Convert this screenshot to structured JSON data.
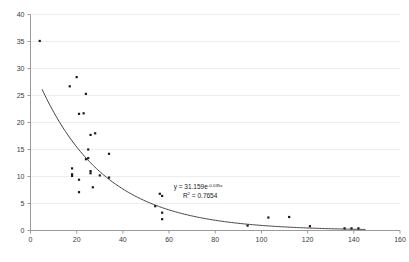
{
  "chart_data": {
    "type": "scatter",
    "title": "",
    "subtitle": "",
    "xlabel": "",
    "ylabel": "",
    "xlim": [
      0,
      160
    ],
    "ylim": [
      0,
      40
    ],
    "xticks": [
      0,
      20,
      40,
      60,
      80,
      100,
      120,
      140,
      160
    ],
    "yticks": [
      0,
      5,
      10,
      15,
      20,
      25,
      30,
      35,
      40
    ],
    "xtick_labels": [
      "0",
      "20",
      "40",
      "60",
      "80",
      "100",
      "120",
      "140",
      "160"
    ],
    "ytick_labels": [
      "0",
      "5",
      "10",
      "15",
      "20",
      "25",
      "30",
      "35",
      "40"
    ],
    "grid": "horizontal",
    "legend": "none",
    "marker_color": "#1a1a1a",
    "marker_shape": "square",
    "marker_size": 2.2,
    "trendline": {
      "type": "exponential",
      "equation_label": "y = 31.159e",
      "equation_exponent": "-0.035x",
      "r2_label": "R",
      "r2_sup": "2",
      "r2_value": " = 0.7654",
      "coefficient": 31.159,
      "rate": -0.035,
      "r_squared": 0.7654,
      "color": "#444444",
      "x_start": 5,
      "x_end": 145
    },
    "annotations": [
      {
        "name": "trendline-equation",
        "text": "y = 31.159e-0.035x",
        "x": 62,
        "y": 7.6
      },
      {
        "name": "trendline-r-squared",
        "text": "R2 = 0.7654",
        "x": 66,
        "y": 6.1
      }
    ],
    "points": [
      {
        "x": 4,
        "y": 35.1
      },
      {
        "x": 17,
        "y": 26.7
      },
      {
        "x": 20,
        "y": 28.4
      },
      {
        "x": 24,
        "y": 25.3
      },
      {
        "x": 21,
        "y": 21.6
      },
      {
        "x": 23,
        "y": 21.7
      },
      {
        "x": 26,
        "y": 17.7
      },
      {
        "x": 28,
        "y": 18.0
      },
      {
        "x": 25,
        "y": 15.0
      },
      {
        "x": 34,
        "y": 14.2
      },
      {
        "x": 25,
        "y": 13.4
      },
      {
        "x": 24,
        "y": 13.2
      },
      {
        "x": 18,
        "y": 11.5
      },
      {
        "x": 18,
        "y": 10.4
      },
      {
        "x": 18,
        "y": 10.1
      },
      {
        "x": 26,
        "y": 11.0
      },
      {
        "x": 26,
        "y": 10.6
      },
      {
        "x": 30,
        "y": 10.2
      },
      {
        "x": 34,
        "y": 9.8
      },
      {
        "x": 21,
        "y": 9.4
      },
      {
        "x": 27,
        "y": 8.0
      },
      {
        "x": 21,
        "y": 7.1
      },
      {
        "x": 56,
        "y": 6.8
      },
      {
        "x": 57,
        "y": 6.4
      },
      {
        "x": 54,
        "y": 4.5
      },
      {
        "x": 57,
        "y": 3.3
      },
      {
        "x": 57,
        "y": 2.1
      },
      {
        "x": 94,
        "y": 0.9
      },
      {
        "x": 103,
        "y": 2.4
      },
      {
        "x": 112,
        "y": 2.5
      },
      {
        "x": 121,
        "y": 0.8
      },
      {
        "x": 136,
        "y": 0.4
      },
      {
        "x": 139,
        "y": 0.4
      },
      {
        "x": 142,
        "y": 0.4
      }
    ]
  }
}
